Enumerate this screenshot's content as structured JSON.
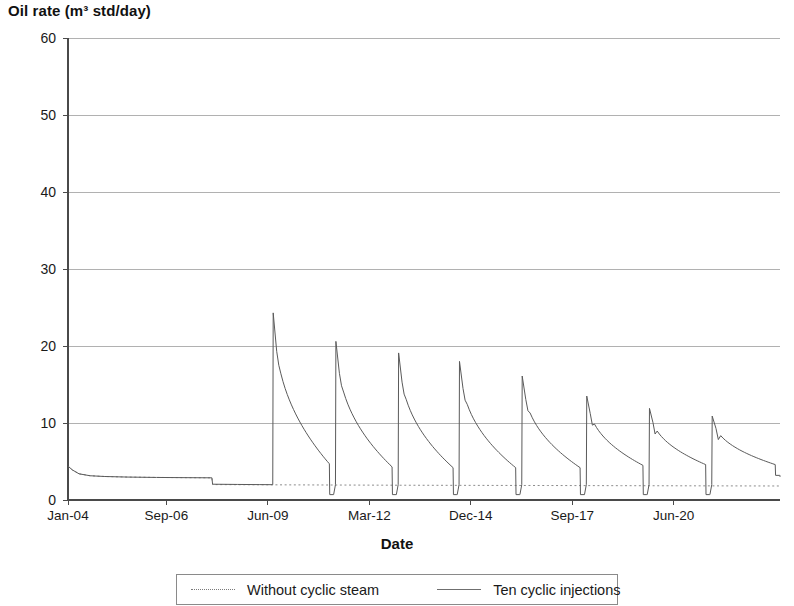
{
  "chart_data": {
    "type": "line",
    "title": "",
    "ylabel": "Oil rate (m³ std/day)",
    "xlabel": "Date",
    "ylim": [
      0,
      60
    ],
    "ytick_values": [
      0,
      10,
      20,
      30,
      40,
      50,
      60
    ],
    "ytick_labels": [
      "0",
      "10",
      "20",
      "30",
      "40",
      "50",
      "60"
    ],
    "xtick_labels": [
      "Jan-04",
      "Sep-06",
      "Jun-09",
      "Mar-12",
      "Dec-14",
      "Sep-17",
      "Jun-20"
    ],
    "x_start": "Jan-04",
    "x_end": "Mar-23",
    "grid": "horizontal",
    "legend_position": "bottom",
    "series": [
      {
        "name": "Without cyclic steam",
        "style": "dotted",
        "color": "#8c8c8c",
        "points": [
          [
            0.0,
            4.4
          ],
          [
            0.12,
            3.9
          ],
          [
            0.3,
            3.4
          ],
          [
            0.6,
            3.15
          ],
          [
            1.0,
            3.05
          ],
          [
            1.6,
            2.98
          ],
          [
            2.4,
            2.93
          ],
          [
            3.2,
            2.9
          ],
          [
            3.9,
            2.88
          ],
          [
            3.92,
            2.0
          ],
          [
            5.0,
            1.98
          ],
          [
            7.0,
            1.95
          ],
          [
            9.0,
            1.92
          ],
          [
            11.0,
            1.9
          ],
          [
            13.0,
            1.88
          ],
          [
            15.0,
            1.86
          ],
          [
            17.0,
            1.84
          ],
          [
            19.3,
            1.82
          ]
        ]
      },
      {
        "name": "Ten cyclic injections",
        "style": "solid",
        "color": "#5a5a5a",
        "description": "Ten cyclic steam injection cycles; each cycle shows a sharp oil-rate spike followed by exponential decline, then a drop to a low value before the next cycle.",
        "cycles": [
          {
            "cycle": 1,
            "start_year": 5.55,
            "peak": 24.3,
            "end_rate": 4.7,
            "drop_to": 0.7,
            "cycle_end": 7.2
          },
          {
            "cycle": 2,
            "start_year": 7.25,
            "peak": 20.6,
            "end_rate": 4.3,
            "drop_to": 0.7,
            "cycle_end": 8.9
          },
          {
            "cycle": 3,
            "start_year": 8.95,
            "peak": 19.1,
            "end_rate": 4.2,
            "drop_to": 0.7,
            "cycle_end": 10.55
          },
          {
            "cycle": 4,
            "start_year": 10.6,
            "peak": 18.0,
            "end_rate": 4.2,
            "drop_to": 0.7,
            "cycle_end": 12.25
          },
          {
            "cycle": 5,
            "start_year": 12.3,
            "peak": 16.1,
            "end_rate": 4.2,
            "drop_to": 0.7,
            "cycle_end": 14.0
          },
          {
            "cycle": 6,
            "start_year": 14.05,
            "peak": 13.5,
            "end_rate": 4.5,
            "drop_to": 0.7,
            "cycle_end": 15.7
          },
          {
            "cycle": 7,
            "start_year": 15.75,
            "peak": 11.9,
            "end_rate": 4.6,
            "drop_to": 0.7,
            "cycle_end": 17.4
          },
          {
            "cycle": 8,
            "start_year": 17.45,
            "peak": 10.9,
            "end_rate": 4.6,
            "drop_to": 3.2,
            "cycle_end": 19.3
          }
        ],
        "peaks": [
          24.3,
          20.6,
          19.1,
          18.0,
          16.1,
          13.5,
          11.9,
          10.9
        ],
        "pre_cycle_baseline": [
          [
            0.0,
            4.4
          ],
          [
            0.12,
            3.9
          ],
          [
            0.3,
            3.4
          ],
          [
            0.6,
            3.15
          ],
          [
            1.0,
            3.05
          ],
          [
            1.6,
            2.98
          ],
          [
            2.4,
            2.93
          ],
          [
            3.2,
            2.9
          ],
          [
            3.9,
            2.88
          ],
          [
            3.92,
            2.05
          ],
          [
            4.6,
            2.02
          ],
          [
            5.2,
            2.0
          ],
          [
            5.54,
            1.99
          ]
        ]
      }
    ]
  },
  "axes": {
    "y_title": "Oil rate (m³ std/day)",
    "x_title": "Date"
  },
  "legend": {
    "entries": [
      {
        "label": "Without cyclic steam",
        "style": "dotted"
      },
      {
        "label": "Ten cyclic injections",
        "style": "solid"
      }
    ]
  },
  "colors": {
    "axis": "#4a4a4a",
    "grid": "#a8a8a8",
    "series_dotted": "#8c8c8c",
    "series_solid": "#5a5a5a",
    "text": "#1a1a1a"
  }
}
